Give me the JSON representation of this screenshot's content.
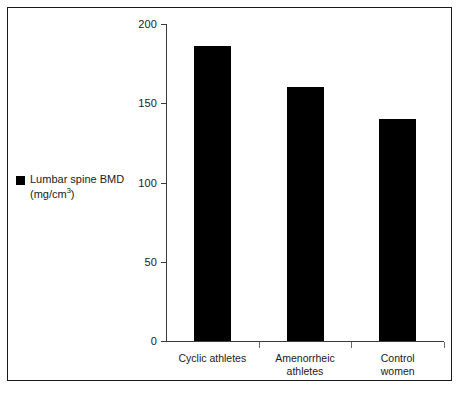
{
  "chart_data": {
    "type": "bar",
    "title": "",
    "subtitle": "",
    "xlabel": "",
    "ylabel": "",
    "categories": [
      "Cyclic athletes",
      "Amenorrheic athletes",
      "Control women"
    ],
    "category_lines": [
      [
        "Cyclic athletes"
      ],
      [
        "Amenorrheic",
        "athletes"
      ],
      [
        "Control",
        "women"
      ]
    ],
    "values": [
      186,
      160,
      140
    ],
    "series": [
      {
        "name": "Lumbar spine BMD (mg/cm3)",
        "values": [
          186,
          160,
          140
        ],
        "color": "#000000"
      }
    ],
    "ylim": [
      0,
      200
    ],
    "yticks": [
      0,
      50,
      100,
      150,
      200
    ],
    "ytick_labels": [
      "0",
      "50",
      "100",
      "150",
      "200"
    ],
    "grid": false,
    "legend_position": "left-outside",
    "bar_color": "#000000",
    "axis_color": "#3a3a3a",
    "frame_color": "#1a1a1a"
  },
  "legend": {
    "swatch_name": "legend-swatch-black-square",
    "line1": "Lumbar spine BMD",
    "line2_prefix": "(mg/cm",
    "line2_exponent": "3",
    "line2_suffix": ")"
  },
  "axes": {
    "y": {
      "ticks": [
        {
          "value": 200,
          "label": "200"
        },
        {
          "value": 150,
          "label": "150"
        },
        {
          "value": 100,
          "label": "100"
        },
        {
          "value": 50,
          "label": "50"
        },
        {
          "value": 0,
          "label": "0"
        }
      ]
    },
    "x": {
      "categories": [
        {
          "line1": "Cyclic athletes",
          "line2": ""
        },
        {
          "line1": "Amenorrheic",
          "line2": "athletes"
        },
        {
          "line1": "Control",
          "line2": "women"
        }
      ]
    }
  },
  "bars": [
    {
      "category": "Cyclic athletes",
      "value": 186
    },
    {
      "category": "Amenorrheic athletes",
      "value": 160
    },
    {
      "category": "Control women",
      "value": 140
    }
  ]
}
